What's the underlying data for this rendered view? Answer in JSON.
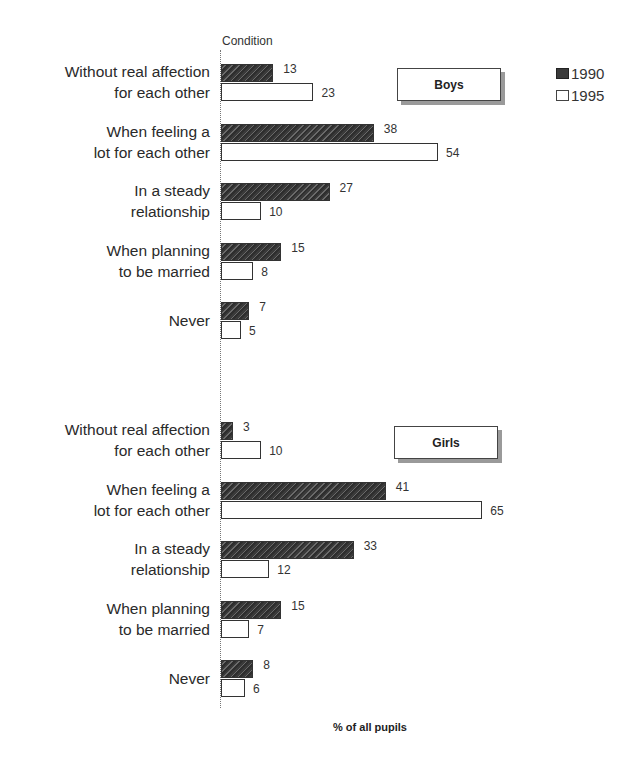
{
  "chart_data": {
    "type": "bar",
    "orientation": "horizontal",
    "title": "",
    "ylabel": "Condition",
    "xlabel": "% of all pupils",
    "legend": [
      "1990",
      "1995"
    ],
    "legend_position": "top-right",
    "grid": false,
    "colors": {
      "1990": "#3a3a3a",
      "1995": "#ffffff"
    },
    "panels": [
      {
        "name": "Boys",
        "categories": [
          "Without real affection for each other",
          "When feeling a lot for each other",
          "In a steady relationship",
          "When planning to be married",
          "Never"
        ],
        "series": [
          {
            "name": "1990",
            "values": [
              13,
              38,
              27,
              15,
              7
            ]
          },
          {
            "name": "1995",
            "values": [
              23,
              54,
              10,
              8,
              5
            ]
          }
        ]
      },
      {
        "name": "Girls",
        "categories": [
          "Without real affection for each other",
          "When feeling a lot for each other",
          "In a steady relationship",
          "When planning to be married",
          "Never"
        ],
        "series": [
          {
            "name": "1990",
            "values": [
              3,
              41,
              33,
              15,
              8
            ]
          },
          {
            "name": "1995",
            "values": [
              10,
              65,
              12,
              7,
              6
            ]
          }
        ]
      }
    ]
  },
  "labels": {
    "condition": "Condition",
    "xaxis": "% of all pupils",
    "legend_1990": "1990",
    "legend_1995": "1995",
    "boys": "Boys",
    "girls": "Girls"
  },
  "categories_display": [
    [
      "Without real affection",
      "for each other"
    ],
    [
      "When feeling a",
      "lot for each other"
    ],
    [
      "In a steady",
      "relationship"
    ],
    [
      "When planning",
      "to be married"
    ],
    [
      "Never"
    ]
  ]
}
